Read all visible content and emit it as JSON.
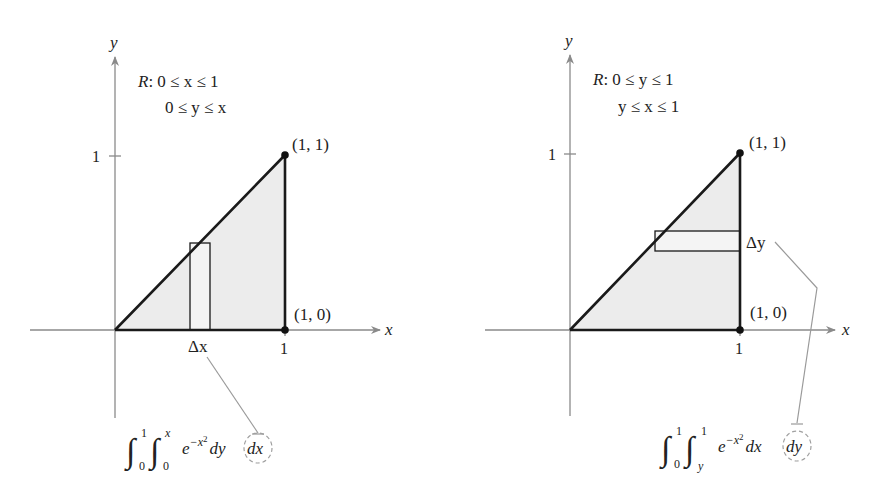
{
  "figures": [
    {
      "id": "left",
      "axis_x_label": "x",
      "axis_y_label": "y",
      "tick_x": "1",
      "tick_y": "1",
      "region_line1": "R: 0 ≤ x ≤ 1",
      "region_line2": "0 ≤ y ≤ x",
      "region_prefix": "R",
      "region_line1_rest": ": 0 ≤ x ≤ 1",
      "point_top": "(1, 1)",
      "point_bottom": "(1, 0)",
      "strip_label": "Δx",
      "integral": {
        "outer_lower": "0",
        "outer_upper": "1",
        "inner_lower": "0",
        "inner_upper": "x",
        "integrand_base": "e",
        "integrand_exp": "−x",
        "integrand_exp_pow": "2",
        "inner_diff": "dy",
        "outer_diff": "dx"
      }
    },
    {
      "id": "right",
      "axis_x_label": "x",
      "axis_y_label": "y",
      "tick_x": "1",
      "tick_y": "1",
      "region_prefix": "R",
      "region_line1_rest": ": 0 ≤ y ≤ 1",
      "region_line2": "y ≤ x ≤ 1",
      "point_top": "(1, 1)",
      "point_bottom": "(1, 0)",
      "strip_label": "Δy",
      "integral": {
        "outer_lower": "0",
        "outer_upper": "1",
        "inner_lower": "y",
        "inner_upper": "1",
        "integrand_base": "e",
        "integrand_exp": "−x",
        "integrand_exp_pow": "2",
        "inner_diff": "dx",
        "outer_diff": "dy"
      }
    }
  ],
  "colors": {
    "region_fill": "#ececec",
    "axis": "#8a8a8a",
    "outline": "#1a1a1a",
    "leader": "#9a9a9a"
  }
}
